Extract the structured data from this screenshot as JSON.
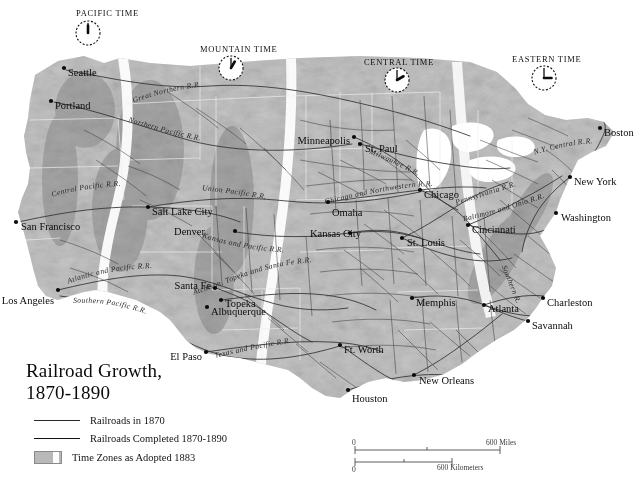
{
  "map": {
    "title_line1": "Railroad Growth,",
    "title_line2": "1870-1890",
    "legend": {
      "item_1870": "Railroads in 1870",
      "item_1870_1890": "Railroads Completed 1870-1890",
      "item_timezones": "Time Zones as Adopted 1883"
    },
    "scale": {
      "miles_zero": "0",
      "miles_max": "600 Miles",
      "km_zero": "0",
      "km_max": "600 Kilometers"
    },
    "colors": {
      "land": "#b4b4b4",
      "ocean": "#ffffff",
      "railroad_1870": "#2f2f2f",
      "railroad_new": "#3a3a3a",
      "timezone_band": "#fbfbfb",
      "text": "#111111"
    },
    "time_zones": [
      {
        "name": "PACIFIC TIME",
        "clock_hour": 12,
        "clock_minute": 0,
        "label_x": 76,
        "label_y": 16,
        "clock_x": 88,
        "clock_y": 33
      },
      {
        "name": "MOUNTAIN TIME",
        "clock_hour": 1,
        "clock_minute": 0,
        "label_x": 200,
        "label_y": 52,
        "clock_x": 231,
        "clock_y": 68
      },
      {
        "name": "CENTRAL TIME",
        "clock_hour": 2,
        "clock_minute": 0,
        "label_x": 364,
        "label_y": 65,
        "clock_x": 397,
        "clock_y": 80
      },
      {
        "name": "EASTERN TIME",
        "clock_hour": 3,
        "clock_minute": 0,
        "label_x": 512,
        "label_y": 62,
        "clock_x": 544,
        "clock_y": 78
      }
    ],
    "cities": [
      {
        "name": "Seattle",
        "dot_x": 64,
        "dot_y": 68,
        "text_x": 68,
        "text_y": 72,
        "anchor": "start"
      },
      {
        "name": "Portland",
        "dot_x": 51,
        "dot_y": 101,
        "text_x": 55,
        "text_y": 105,
        "anchor": "start"
      },
      {
        "name": "San Francisco",
        "dot_x": 16,
        "dot_y": 222,
        "text_x": 21,
        "text_y": 226,
        "anchor": "start"
      },
      {
        "name": "Los Angeles",
        "dot_x": 58,
        "dot_y": 290,
        "text_x": 54,
        "text_y": 300,
        "anchor": "end"
      },
      {
        "name": "Salt Lake City",
        "dot_x": 148,
        "dot_y": 207,
        "text_x": 152,
        "text_y": 211,
        "anchor": "start"
      },
      {
        "name": "Denver",
        "dot_x": 235,
        "dot_y": 231,
        "text_x": 205,
        "text_y": 231,
        "anchor": "end"
      },
      {
        "name": "Santa Fe",
        "dot_x": 215,
        "dot_y": 288,
        "text_x": 211,
        "text_y": 285,
        "anchor": "end"
      },
      {
        "name": "Topeka",
        "dot_x": 221,
        "dot_y": 300,
        "text_x": 225,
        "text_y": 303,
        "anchor": "start"
      },
      {
        "name": "Albuquerque",
        "dot_x": 207,
        "dot_y": 307,
        "text_x": 211,
        "text_y": 311,
        "anchor": "start"
      },
      {
        "name": "El Paso",
        "dot_x": 206,
        "dot_y": 352,
        "text_x": 202,
        "text_y": 356,
        "anchor": "end"
      },
      {
        "name": "Minneapolis",
        "dot_x": 354,
        "dot_y": 137,
        "text_x": 350,
        "text_y": 140,
        "anchor": "end"
      },
      {
        "name": "St. Paul",
        "dot_x": 360,
        "dot_y": 144,
        "text_x": 365,
        "text_y": 148,
        "anchor": "start"
      },
      {
        "name": "Omaha",
        "dot_x": 328,
        "dot_y": 202,
        "text_x": 332,
        "text_y": 212,
        "anchor": "start"
      },
      {
        "name": "Kansas City",
        "dot_x": 350,
        "dot_y": 233,
        "text_x": 310,
        "text_y": 233,
        "anchor": "start"
      },
      {
        "name": "St. Louis",
        "dot_x": 402,
        "dot_y": 238,
        "text_x": 407,
        "text_y": 242,
        "anchor": "start"
      },
      {
        "name": "Chicago",
        "dot_x": 420,
        "dot_y": 190,
        "text_x": 424,
        "text_y": 194,
        "anchor": "start"
      },
      {
        "name": "Cincinnati",
        "dot_x": 468,
        "dot_y": 225,
        "text_x": 472,
        "text_y": 229,
        "anchor": "start"
      },
      {
        "name": "Memphis",
        "dot_x": 412,
        "dot_y": 298,
        "text_x": 416,
        "text_y": 302,
        "anchor": "start"
      },
      {
        "name": "Atlanta",
        "dot_x": 484,
        "dot_y": 305,
        "text_x": 488,
        "text_y": 308,
        "anchor": "start"
      },
      {
        "name": "Charleston",
        "dot_x": 543,
        "dot_y": 298,
        "text_x": 547,
        "text_y": 302,
        "anchor": "start"
      },
      {
        "name": "Savannah",
        "dot_x": 528,
        "dot_y": 321,
        "text_x": 532,
        "text_y": 325,
        "anchor": "start"
      },
      {
        "name": "New Orleans",
        "dot_x": 414,
        "dot_y": 375,
        "text_x": 419,
        "text_y": 380,
        "anchor": "start"
      },
      {
        "name": "Houston",
        "dot_x": 348,
        "dot_y": 390,
        "text_x": 352,
        "text_y": 398,
        "anchor": "start"
      },
      {
        "name": "Ft. Worth",
        "dot_x": 340,
        "dot_y": 345,
        "text_x": 344,
        "text_y": 349,
        "anchor": "start"
      },
      {
        "name": "Washington",
        "dot_x": 556,
        "dot_y": 213,
        "text_x": 561,
        "text_y": 217,
        "anchor": "start"
      },
      {
        "name": "New York",
        "dot_x": 570,
        "dot_y": 177,
        "text_x": 574,
        "text_y": 181,
        "anchor": "start"
      },
      {
        "name": "Boston",
        "dot_x": 600,
        "dot_y": 128,
        "text_x": 604,
        "text_y": 132,
        "anchor": "start"
      }
    ],
    "railroad_names": [
      {
        "name": "Great Northern R.R.",
        "path_id": "rr-great-northern",
        "offset": "8%"
      },
      {
        "name": "Northern Pacific R.R.",
        "path_id": "rr-northern-pacific",
        "offset": "5%"
      },
      {
        "name": "Central Pacific R.R.",
        "path_id": "rr-central-pacific",
        "offset": "6%"
      },
      {
        "name": "Union Pacific R.R.",
        "path_id": "rr-union-pacific",
        "offset": "4%"
      },
      {
        "name": "Kansas and Pacific R.R.",
        "path_id": "rr-kansas-pacific",
        "offset": "3%"
      },
      {
        "name": "Atchison, Topeka and Santa Fe R.R.",
        "path_id": "rr-atsf",
        "offset": "3%"
      },
      {
        "name": "Atlantic and Pacific R.R.",
        "path_id": "rr-atlantic-pacific",
        "offset": "4%"
      },
      {
        "name": "Southern Pacific R.R.",
        "path_id": "rr-southern-pacific",
        "offset": "6%"
      },
      {
        "name": "Texas and Pacific R.R.",
        "path_id": "rr-texas-pacific",
        "offset": "6%"
      },
      {
        "name": "Chicago and Northwestern R.R.",
        "path_id": "rr-chicago-nw",
        "offset": "3%"
      },
      {
        "name": "Milwaukee R.R.",
        "path_id": "rr-milwaukee",
        "offset": "10%"
      },
      {
        "name": "Pennsylvania R.R.",
        "path_id": "rr-pennsylvania",
        "offset": "4%"
      },
      {
        "name": "Baltimore and Ohio R.R.",
        "path_id": "rr-baltimore-ohio",
        "offset": "3%"
      },
      {
        "name": "Southern R.R.",
        "path_id": "rr-southern",
        "offset": "10%"
      },
      {
        "name": "N.Y. Central R.R.",
        "path_id": "rr-ny-central",
        "offset": "6%"
      }
    ]
  }
}
